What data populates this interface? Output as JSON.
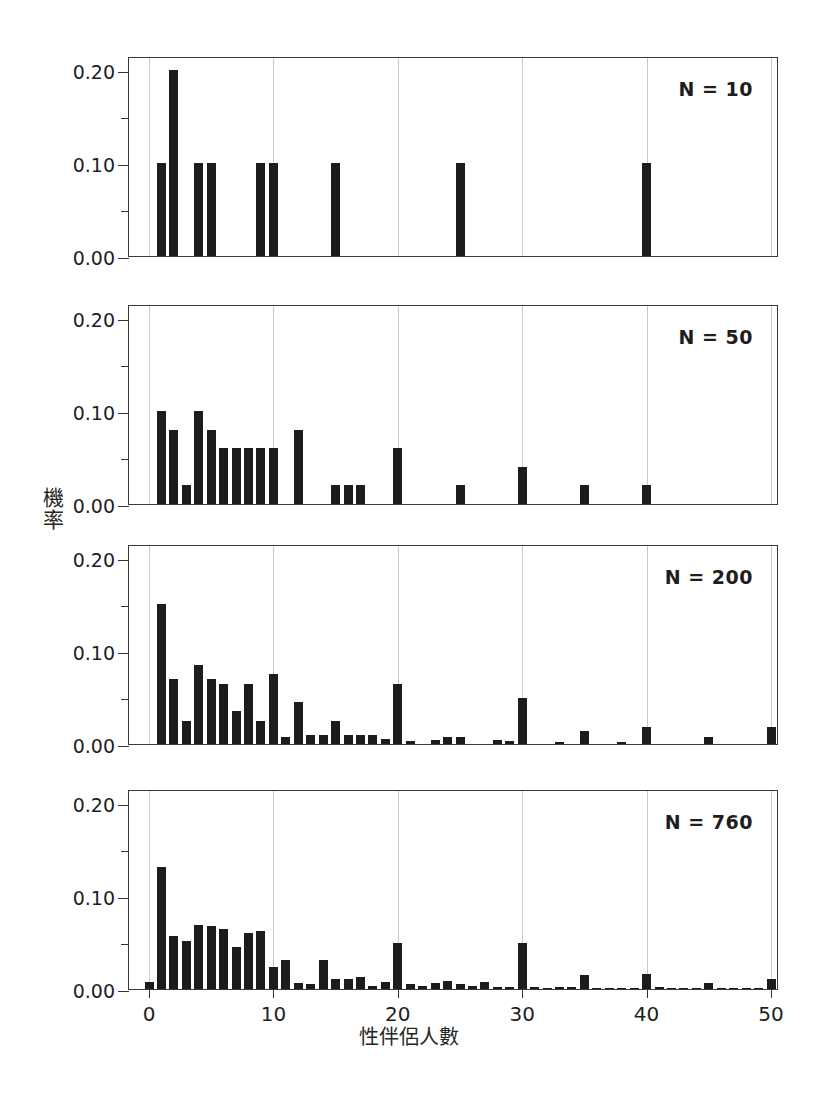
{
  "figure": {
    "ylabel_chars": [
      "機",
      "率"
    ],
    "ylabel_text": "機率",
    "xlabel_text": "性伴侶人數",
    "bar_color": "#1c1c1c",
    "grid_color": "#c9c9c9",
    "axis_color": "#3a3a3a"
  },
  "axis": {
    "y_ticks": [
      "0.00",
      "0.10",
      "0.20"
    ],
    "y_minor_ticks": [
      "0.05",
      "0.15"
    ],
    "x_ticks": [
      "0",
      "10",
      "20",
      "30",
      "40",
      "50"
    ]
  },
  "chart_data": {
    "type": "bar",
    "title": "",
    "xlabel": "性伴侶人數",
    "ylabel": "機率",
    "xlim": [
      -1.5,
      51.5
    ],
    "ylim": [
      0.0,
      0.215
    ],
    "grid": "vertical gridlines at x = 0,10,20,30,40,50",
    "legend": "none (N annotation in top-right of each panel)",
    "panels": [
      {
        "label": "N = 10",
        "n": 10,
        "x": [
          1,
          2,
          4,
          5,
          9,
          10,
          15,
          25,
          40
        ],
        "values": [
          0.1,
          0.2,
          0.1,
          0.1,
          0.1,
          0.1,
          0.1,
          0.1,
          0.1
        ]
      },
      {
        "label": "N = 50",
        "n": 50,
        "x": [
          1,
          2,
          3,
          4,
          5,
          6,
          7,
          8,
          9,
          10,
          12,
          15,
          16,
          17,
          20,
          25,
          30,
          35,
          40
        ],
        "values": [
          0.1,
          0.08,
          0.02,
          0.1,
          0.08,
          0.06,
          0.06,
          0.06,
          0.06,
          0.06,
          0.08,
          0.02,
          0.02,
          0.02,
          0.06,
          0.02,
          0.04,
          0.02,
          0.02
        ]
      },
      {
        "label": "N = 200",
        "n": 200,
        "x": [
          1,
          2,
          3,
          4,
          5,
          6,
          7,
          8,
          9,
          10,
          11,
          12,
          13,
          14,
          15,
          16,
          17,
          18,
          19,
          20,
          21,
          23,
          24,
          25,
          28,
          29,
          30,
          33,
          35,
          38,
          40,
          45,
          50
        ],
        "values": [
          0.15,
          0.07,
          0.025,
          0.085,
          0.07,
          0.065,
          0.035,
          0.065,
          0.025,
          0.075,
          0.008,
          0.045,
          0.01,
          0.01,
          0.025,
          0.01,
          0.01,
          0.01,
          0.005,
          0.065,
          0.003,
          0.004,
          0.008,
          0.008,
          0.004,
          0.003,
          0.05,
          0.002,
          0.014,
          0.002,
          0.018,
          0.008,
          0.018
        ]
      },
      {
        "label": "N = 760",
        "n": 760,
        "x": [
          0,
          1,
          2,
          3,
          4,
          5,
          6,
          7,
          8,
          9,
          10,
          11,
          12,
          13,
          14,
          15,
          16,
          17,
          18,
          19,
          20,
          21,
          22,
          23,
          24,
          25,
          26,
          27,
          28,
          29,
          30,
          31,
          32,
          33,
          34,
          35,
          36,
          37,
          38,
          39,
          40,
          41,
          42,
          43,
          44,
          45,
          46,
          47,
          48,
          49,
          50
        ],
        "values": [
          0.008,
          0.131,
          0.057,
          0.052,
          0.069,
          0.068,
          0.065,
          0.045,
          0.06,
          0.062,
          0.024,
          0.031,
          0.007,
          0.005,
          0.031,
          0.011,
          0.011,
          0.013,
          0.003,
          0.008,
          0.05,
          0.005,
          0.003,
          0.007,
          0.009,
          0.005,
          0.003,
          0.008,
          0.002,
          0.002,
          0.05,
          0.002,
          0.001,
          0.002,
          0.002,
          0.015,
          0.001,
          0.001,
          0.001,
          0.001,
          0.016,
          0.002,
          0.001,
          0.001,
          0.001,
          0.006,
          0.001,
          0.001,
          0.001,
          0.001,
          0.011
        ]
      }
    ]
  }
}
